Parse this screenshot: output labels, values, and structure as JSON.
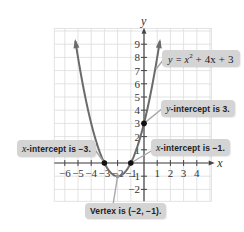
{
  "chart_data": {
    "type": "line",
    "title": "",
    "equation": "y = x² + 4x + 3",
    "xlabel": "x",
    "ylabel": "y",
    "xlim": [
      -6,
      4
    ],
    "ylim": [
      -3,
      10
    ],
    "grid": true,
    "x_ticks": [
      -6,
      -5,
      -4,
      -3,
      -2,
      -1,
      1,
      2,
      3,
      4
    ],
    "y_ticks": [
      -2,
      -1,
      1,
      2,
      3,
      4,
      5,
      6,
      7,
      8,
      9
    ],
    "series": [
      {
        "name": "y = x^2 + 4x + 3",
        "color": "#6b6b6b",
        "x": [
          -5.2,
          -5,
          -4.5,
          -4,
          -3.5,
          -3,
          -2.5,
          -2,
          -1.5,
          -1,
          -0.5,
          0,
          0.5,
          1.2
        ],
        "values": [
          4.24,
          3,
          1.25,
          0,
          -0.75,
          0,
          -0.75,
          -1,
          -0.75,
          0,
          1.25,
          3,
          5.25,
          9.24
        ]
      }
    ],
    "points": [
      {
        "label": "x-intercept",
        "x": -3,
        "y": 0
      },
      {
        "label": "x-intercept",
        "x": -1,
        "y": 0
      },
      {
        "label": "y-intercept",
        "x": 0,
        "y": 3
      },
      {
        "label": "vertex",
        "x": -2,
        "y": -1
      }
    ],
    "annotations": [
      "y = x² + 4x + 3",
      "y-intercept is 3.",
      "x-intercept is −3.",
      "x-intercept is −1.",
      "Vertex is (−2, −1)."
    ]
  },
  "labels": {
    "axis_x": "x",
    "axis_y": "y",
    "equation_prefix": "y = x",
    "equation_exp": "2",
    "equation_suffix": " + 4x + 3",
    "y_intercept_var": "y",
    "y_intercept_text": "-intercept is 3.",
    "x_intercept_left_var": "x",
    "x_intercept_left_text": "-intercept is −3.",
    "x_intercept_right_var": "x",
    "x_intercept_right_text": "-intercept is −1.",
    "vertex_text": "Vertex is (−2, −1)."
  },
  "colors": {
    "grid": "#dcdcdc",
    "axis": "#444444",
    "curve": "#6b6b6b",
    "callout_bg": "#d4d4d4",
    "point": "#111111"
  }
}
